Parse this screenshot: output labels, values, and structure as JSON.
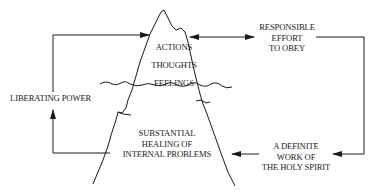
{
  "diagram": {
    "type": "iceberg-cycle",
    "colors": {
      "ink": "#1a1a1a",
      "background": "#ffffff"
    },
    "iceberg": {
      "above_water": [
        "ACTIONS",
        "THOUGHTS",
        "FEELINGS"
      ],
      "below_water": [
        "SUBSTANTIAL",
        "HEALING OF",
        "INTERNAL PROBLEMS"
      ]
    },
    "right_top": [
      "RESPONSIBLE",
      "EFFORT",
      "TO OBEY"
    ],
    "right_bottom": [
      "A DEFINITE",
      "WORK OF",
      "THE HOLY SPIRIT"
    ],
    "left": "LIBERATING POWER",
    "connections": [
      {
        "from": "RESPONSIBLE EFFORT TO OBEY",
        "to": "ACTIONS THOUGHTS FEELINGS",
        "type": "bidirectional"
      },
      {
        "from": "RESPONSIBLE EFFORT TO OBEY",
        "to": "A DEFINITE WORK OF THE HOLY SPIRIT",
        "type": "arrow"
      },
      {
        "from": "A DEFINITE WORK OF THE HOLY SPIRIT",
        "to": "SUBSTANTIAL HEALING OF INTERNAL PROBLEMS",
        "type": "arrow"
      },
      {
        "from": "SUBSTANTIAL HEALING OF INTERNAL PROBLEMS",
        "to": "LIBERATING POWER",
        "type": "arrow"
      },
      {
        "from": "LIBERATING POWER",
        "to": "ACTIONS THOUGHTS FEELINGS",
        "type": "arrow"
      }
    ]
  }
}
